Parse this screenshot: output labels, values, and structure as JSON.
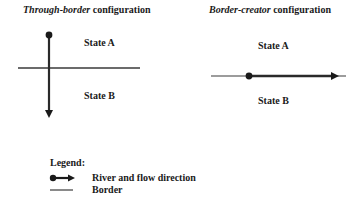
{
  "panels": [
    {
      "title_italic": "Through-border",
      "title_rest": " configuration",
      "state_a": "State A",
      "state_b": "State B"
    },
    {
      "title_italic": "Border-creator",
      "title_rest": " configuration",
      "state_a": "State A",
      "state_b": "State B"
    }
  ],
  "legend": {
    "heading": "Legend:",
    "items": [
      {
        "icon": "river-arrow-icon",
        "label": "River and flow direction"
      },
      {
        "icon": "border-line-icon",
        "label": "Border"
      }
    ]
  },
  "colors": {
    "line": "#2a2a2a",
    "background": "#ffffff"
  }
}
